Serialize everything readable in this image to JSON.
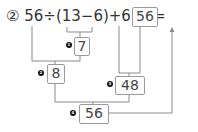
{
  "problem": {
    "number_label": "②",
    "expression": "56÷(13−6)+6×8=",
    "answer": "56"
  },
  "steps": [
    {
      "marker": "1",
      "value": "7",
      "operation": "13−6"
    },
    {
      "marker": "2",
      "value": "8",
      "operation": "56÷7"
    },
    {
      "marker": "3",
      "value": "48",
      "operation": "6×8"
    },
    {
      "marker": "4",
      "value": "56",
      "operation": "8+48"
    }
  ],
  "colors": {
    "text": "#333333",
    "line": "#8a8a8a",
    "marker": "#111111"
  }
}
